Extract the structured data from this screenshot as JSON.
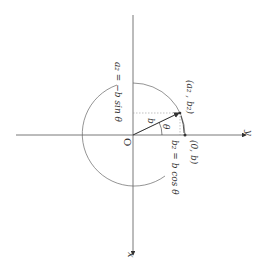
{
  "diagram": {
    "type": "rotated-circle-coordinate-diagram",
    "axes": {
      "horizontal_label": "y",
      "vertical_label": "x",
      "origin_label": "O"
    },
    "labels": {
      "point_a2_b2": "(a₂ , b₂)",
      "point_0_b": "(0, b)",
      "a2_eq": "a₂ = −b sin θ",
      "b2_eq": "b₂ = b cos θ",
      "radius": "b",
      "angle": "θ"
    },
    "colors": {
      "line": "#555555",
      "dotted": "#999999",
      "text": "#333333"
    }
  }
}
